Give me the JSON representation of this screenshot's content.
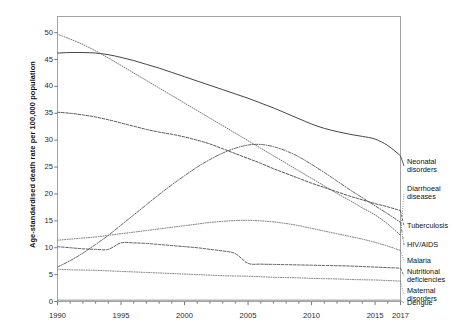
{
  "chart_data": {
    "type": "line",
    "title": "",
    "xlabel": "",
    "ylabel": "Age-standardised death rate per 100,000 population",
    "xlim": [
      1990,
      2017
    ],
    "ylim": [
      0,
      53
    ],
    "grid": false,
    "legend_position": "right",
    "x_ticks": [
      "1990",
      "1995",
      "2000",
      "2005",
      "2010",
      "2015",
      "2017"
    ],
    "x_tick_values": [
      1990,
      1995,
      2000,
      2005,
      2010,
      2015,
      2017
    ],
    "y_ticks": [
      "0",
      "5",
      "10",
      "15",
      "20",
      "25",
      "30",
      "35",
      "40",
      "45",
      "50"
    ],
    "y_tick_values": [
      0,
      5,
      10,
      15,
      20,
      25,
      30,
      35,
      40,
      45,
      50
    ],
    "x": [
      1990,
      1991,
      1992,
      1993,
      1994,
      1995,
      1996,
      1997,
      1998,
      1999,
      2000,
      2001,
      2002,
      2003,
      2004,
      2005,
      2006,
      2007,
      2008,
      2009,
      2010,
      2011,
      2012,
      2013,
      2014,
      2015,
      2016,
      2017
    ],
    "series": [
      {
        "name": "Neonatal disorders",
        "style": "solid",
        "color": "#3a3a3a",
        "values": [
          46.2,
          46.3,
          46.3,
          46.2,
          45.9,
          45.4,
          44.8,
          44.1,
          43.4,
          42.6,
          41.8,
          41.0,
          40.2,
          39.4,
          38.6,
          37.8,
          36.9,
          36.0,
          35.0,
          34.0,
          33.0,
          32.2,
          31.6,
          31.1,
          30.7,
          30.2,
          29.0,
          27.1
        ]
      },
      {
        "name": "Diarrhoeal diseases",
        "style": "dotted",
        "color": "#6e6e6e",
        "values": [
          49.7,
          48.8,
          47.8,
          46.6,
          45.3,
          43.9,
          42.5,
          41.1,
          39.7,
          38.3,
          36.9,
          35.5,
          34.1,
          32.7,
          31.3,
          29.9,
          28.5,
          27.1,
          25.7,
          24.3,
          22.9,
          21.5,
          20.1,
          18.8,
          17.4,
          16.1,
          14.4,
          12.3
        ]
      },
      {
        "name": "Tuberculosis",
        "style": "dashed",
        "color": "#4a4a4a",
        "values": [
          35.2,
          35.0,
          34.7,
          34.3,
          33.8,
          33.2,
          32.6,
          32.0,
          31.5,
          31.1,
          30.6,
          30.0,
          29.3,
          28.4,
          27.5,
          26.6,
          25.7,
          24.7,
          23.8,
          22.9,
          22.0,
          21.2,
          20.4,
          19.6,
          18.9,
          18.2,
          17.6,
          16.9
        ]
      },
      {
        "name": "HIV/AIDS",
        "style": "dashdot",
        "color": "#5a5a5a",
        "values": [
          6.4,
          7.6,
          9.0,
          10.6,
          12.3,
          14.2,
          16.1,
          18.0,
          19.9,
          21.7,
          23.4,
          25.0,
          26.4,
          27.6,
          28.5,
          29.1,
          29.2,
          28.8,
          28.0,
          26.9,
          25.5,
          24.0,
          22.4,
          20.8,
          19.3,
          17.8,
          16.3,
          14.7
        ]
      },
      {
        "name": "Malaria",
        "style": "dotted",
        "color": "#6a6a6a",
        "values": [
          11.4,
          11.6,
          11.8,
          12.0,
          12.3,
          12.6,
          12.9,
          13.2,
          13.5,
          13.8,
          14.1,
          14.4,
          14.7,
          14.9,
          15.05,
          15.1,
          15.0,
          14.8,
          14.5,
          14.1,
          13.6,
          13.1,
          12.6,
          12.1,
          11.6,
          11.0,
          10.3,
          9.5
        ]
      },
      {
        "name": "Nutritional deficiencies",
        "style": "dashed",
        "color": "#555555",
        "values": [
          10.2,
          10.0,
          9.8,
          9.7,
          9.7,
          10.9,
          10.9,
          10.8,
          10.6,
          10.4,
          10.2,
          10.0,
          9.7,
          9.4,
          8.9,
          7.1,
          6.95,
          6.9,
          6.85,
          6.8,
          6.75,
          6.7,
          6.65,
          6.6,
          6.5,
          6.4,
          6.3,
          6.2
        ]
      },
      {
        "name": "Maternal disorders",
        "style": "dotted",
        "color": "#707070",
        "values": [
          6.0,
          5.9,
          5.85,
          5.8,
          5.7,
          5.6,
          5.5,
          5.4,
          5.3,
          5.2,
          5.1,
          5.0,
          4.9,
          4.8,
          4.75,
          4.7,
          4.6,
          4.5,
          4.45,
          4.4,
          4.3,
          4.25,
          4.2,
          4.1,
          4.05,
          4.0,
          3.9,
          3.8
        ]
      },
      {
        "name": "Dengue",
        "style": "solid",
        "color": "#858585",
        "values": [
          0.25,
          0.25,
          0.25,
          0.25,
          0.25,
          0.25,
          0.25,
          0.25,
          0.25,
          0.25,
          0.25,
          0.25,
          0.25,
          0.25,
          0.25,
          0.25,
          0.25,
          0.25,
          0.25,
          0.25,
          0.25,
          0.25,
          0.25,
          0.25,
          0.25,
          0.25,
          0.25,
          0.25
        ]
      }
    ],
    "legend_entries": [
      {
        "label_line1": "Neonatal",
        "label_line2": "disorders"
      },
      {
        "label_line1": "Diarrhoeal",
        "label_line2": "diseases"
      },
      {
        "label_line1": "Tuberculosis",
        "label_line2": ""
      },
      {
        "label_line1": "HIV/AIDS",
        "label_line2": ""
      },
      {
        "label_line1": "Malaria",
        "label_line2": ""
      },
      {
        "label_line1": "Nutritional",
        "label_line2": "deficiencies"
      },
      {
        "label_line1": "Maternal",
        "label_line2": "disorders"
      },
      {
        "label_line1": "Dengue",
        "label_line2": ""
      }
    ]
  }
}
